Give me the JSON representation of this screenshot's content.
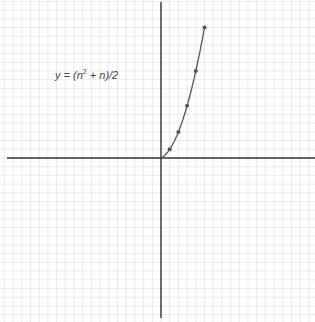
{
  "chart_data": {
    "type": "line",
    "title": "",
    "annotation": "y = (n² + n)/2",
    "xlabel": "",
    "ylabel": "",
    "grid": true,
    "x": [
      0,
      1,
      2,
      3,
      4,
      5
    ],
    "series": [
      {
        "name": "y = (n^2 + n)/2",
        "values": [
          0,
          1,
          3,
          6,
          10,
          15
        ],
        "markers": true
      }
    ],
    "xlim": [
      -18,
      18
    ],
    "ylim": [
      -18.5,
      18.5
    ],
    "colors": {
      "grid": "#dcdcdc",
      "axis": "#333333",
      "line": "#555555",
      "marker": "#555555"
    }
  },
  "annotation": {
    "prefix": "y = (n",
    "sup": "2",
    "suffix": " + n)/2"
  }
}
